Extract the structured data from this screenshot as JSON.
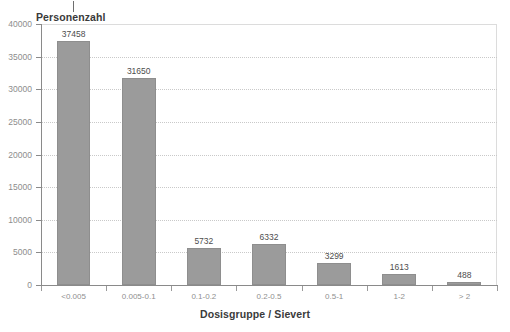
{
  "chart_data": {
    "type": "bar",
    "title": "",
    "ylabel": "Personenzahl",
    "xlabel": "Dosisgruppe / Sievert",
    "categories": [
      "<0.005",
      "0.005-0.1",
      "0.1-0.2",
      "0.2-0.5",
      "0.5-1",
      "1-2",
      "> 2"
    ],
    "values": [
      37458,
      31650,
      5732,
      6332,
      3299,
      1613,
      488
    ],
    "value_labels": [
      "37458",
      "31650",
      "5732",
      "6332",
      "3299",
      "1613",
      "488"
    ],
    "ylim": [
      0,
      40000
    ],
    "yticks": [
      0,
      5000,
      10000,
      15000,
      20000,
      25000,
      30000,
      35000,
      40000
    ],
    "ytick_labels": [
      "0",
      "5000",
      "10000",
      "15000",
      "20000",
      "25000",
      "30000",
      "35000",
      "40000"
    ],
    "grid": true,
    "legend": "none",
    "bar_color": "#9b9b9b",
    "bar_edge_color": "#8e8e8e",
    "axis_color": "#8a8a8a",
    "grid_color": "#c9c9c9",
    "tick_label_color": "#8d8d8d",
    "title_color": "#3a3a3a"
  }
}
